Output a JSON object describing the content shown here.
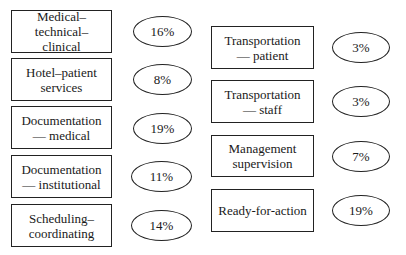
{
  "left_column": [
    {
      "label": "Medical–technical–\nclinical",
      "percent": "16%"
    },
    {
      "label": "Hotel–patient\nservices",
      "percent": "8%"
    },
    {
      "label": "Documentation\n— medical",
      "percent": "19%"
    },
    {
      "label": "Documentation\n— institutional",
      "percent": "11%"
    },
    {
      "label": "Scheduling–\ncoordinating",
      "percent": "14%"
    }
  ],
  "right_column": [
    {
      "label": "Transportation\n— patient",
      "percent": "3%"
    },
    {
      "label": "Transportation\n— staff",
      "percent": "3%"
    },
    {
      "label": "Management\nsupervision",
      "percent": "7%"
    },
    {
      "label": "Ready-for-action",
      "percent": "19%"
    }
  ]
}
